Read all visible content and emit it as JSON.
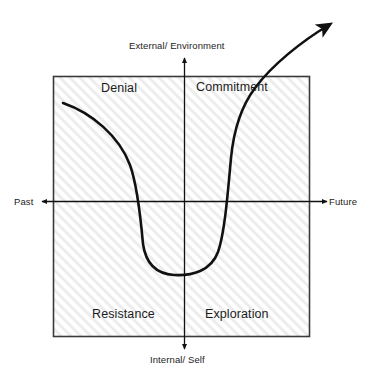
{
  "diagram": {
    "axes": {
      "vertical": {
        "top_label": "External/ Environment",
        "bottom_label": "Internal/ Self"
      },
      "horizontal": {
        "left_label": "Past",
        "right_label": "Future"
      }
    },
    "quadrants": [
      {
        "key": "top-left",
        "label": "Denial"
      },
      {
        "key": "top-right",
        "label": "Commitment"
      },
      {
        "key": "bottom-left",
        "label": "Resistance"
      },
      {
        "key": "bottom-right",
        "label": "Exploration"
      }
    ],
    "colors": {
      "line": "#111111",
      "box_border": "#3a3a3a",
      "box_fill": "#ffffff",
      "hatch": "#ededed",
      "text": "#1c1c1c",
      "background": "#ffffff"
    },
    "curve": {
      "description": "J-shaped change curve descending from Denial through Resistance, bottoming in the lower middle, then rising steeply through Exploration and Commitment and exiting top-right with an arrowhead",
      "start_point": [
        63,
        103
      ],
      "trough_point": [
        187,
        274
      ],
      "arrow_tip": [
        334,
        22
      ]
    },
    "plot_box": {
      "x": 53,
      "y": 76,
      "width": 257,
      "height": 261
    }
  }
}
